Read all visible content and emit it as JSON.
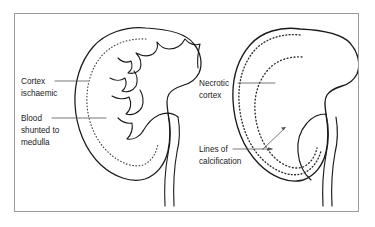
{
  "figure": {
    "type": "medical-diagram",
    "background_color": "#ffffff",
    "frame_color": "#9a9a9a",
    "ink_color": "#1a1a1a",
    "leader_color": "#555555",
    "panels": [
      {
        "id": "left-kidney",
        "name": "acute-cortical-ischaemia",
        "dotted_lines": 1,
        "has_calyces": true
      },
      {
        "id": "right-kidney",
        "name": "cortical-necrosis-with-calcification",
        "dotted_lines": 2,
        "has_calyces": false
      }
    ]
  },
  "labels": {
    "cortex_ischaemic": {
      "lines": [
        "Cortex",
        "ischaemic"
      ],
      "line1": "Cortex",
      "line2": "ischaemic"
    },
    "blood_shunted": {
      "lines": [
        "Blood",
        "shunted to",
        "medulla"
      ],
      "line1": "Blood",
      "line2": "shunted to",
      "line3": "medulla"
    },
    "necrotic_cortex": {
      "lines": [
        "Necrotic",
        "cortex"
      ],
      "line1": "Necrotic",
      "line2": "cortex"
    },
    "lines_of_calcification": {
      "lines": [
        "Lines of",
        "calcification"
      ],
      "line1": "Lines of",
      "line2": "calcification"
    }
  }
}
